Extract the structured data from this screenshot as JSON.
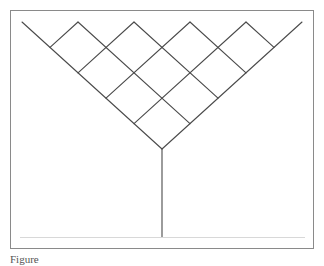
{
  "figure": {
    "frame": {
      "x": 10,
      "y": 10,
      "width": 303,
      "height": 238,
      "stroke": "#8a8a8a"
    },
    "line_color": "#4a4a4a",
    "baseline": {
      "x1": 20,
      "x2": 305,
      "y": 237,
      "stroke": "#d0d0d0"
    },
    "lattice": {
      "left_arm_top": [
        22,
        22
      ],
      "right_arm_top": [
        302,
        22
      ],
      "apex": [
        162,
        149
      ],
      "stem_bottom": [
        162,
        237
      ],
      "peaks_x": [
        78,
        134,
        190,
        246
      ],
      "top_y": 22,
      "half_step_x": 28,
      "half_step_y": 25.4,
      "cells_per_arm": 5
    }
  },
  "caption": {
    "text": "Figure"
  }
}
